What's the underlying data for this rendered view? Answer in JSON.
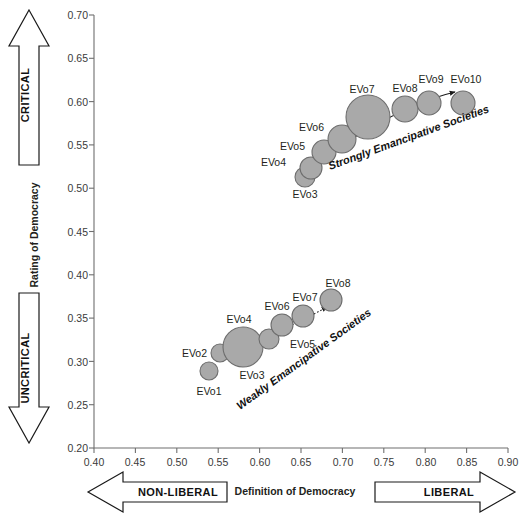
{
  "chart_data": {
    "type": "scatter",
    "title": "",
    "xlabel": "Definition of Democracy",
    "ylabel": "Rating of Democracy",
    "xlim": [
      0.4,
      0.9
    ],
    "ylim": [
      0.2,
      0.7
    ],
    "xticks": [
      "0.40",
      "0.45",
      "0.50",
      "0.55",
      "0.60",
      "0.65",
      "0.70",
      "0.75",
      "0.80",
      "0.85",
      "0.90"
    ],
    "yticks": [
      "0.20",
      "0.25",
      "0.30",
      "0.35",
      "0.40",
      "0.45",
      "0.50",
      "0.55",
      "0.60",
      "0.65",
      "0.70"
    ],
    "grid": false,
    "legend_position": "none",
    "bubble_note": "marker area encodes relative group size",
    "series": [
      {
        "name": "Strongly Emancipative Societies",
        "label": "Strongly Emancipative Societies",
        "trend": "solid-arrow",
        "points": [
          {
            "label": "EVo3",
            "x": 0.653,
            "y": 0.518,
            "size": 10
          },
          {
            "label": "EVo4",
            "x": 0.66,
            "y": 0.529,
            "size": 11
          },
          {
            "label": "EVo5",
            "x": 0.676,
            "y": 0.547,
            "size": 12
          },
          {
            "label": "EVo6",
            "x": 0.697,
            "y": 0.562,
            "size": 14
          },
          {
            "label": "EVo7",
            "x": 0.729,
            "y": 0.588,
            "size": 22
          },
          {
            "label": "EVo8",
            "x": 0.773,
            "y": 0.597,
            "size": 13
          },
          {
            "label": "EVo9",
            "x": 0.802,
            "y": 0.604,
            "size": 12
          },
          {
            "label": "EVo10",
            "x": 0.843,
            "y": 0.604,
            "size": 12
          }
        ]
      },
      {
        "name": "Weakly Emancipative Societies",
        "label": "Weakly Emancipative Societies",
        "trend": "dotted-arrow",
        "points": [
          {
            "label": "EVo1",
            "x": 0.556,
            "y": 0.279,
            "size": 9
          },
          {
            "label": "EVo2",
            "x": 0.567,
            "y": 0.3,
            "size": 9
          },
          {
            "label": "EVo3",
            "x": 0.592,
            "y": 0.308,
            "size": 20
          },
          {
            "label": "EVo4",
            "x": 0.592,
            "y": 0.308,
            "size": 20
          },
          {
            "label": "EVo5",
            "x": 0.619,
            "y": 0.317,
            "size": 10
          },
          {
            "label": "EVo6",
            "x": 0.63,
            "y": 0.333,
            "size": 11
          },
          {
            "label": "EVo7",
            "x": 0.647,
            "y": 0.344,
            "size": 11
          },
          {
            "label": "EVo8",
            "x": 0.667,
            "y": 0.362,
            "size": 11
          }
        ]
      }
    ]
  },
  "axes": {
    "y_title": "Rating of Democracy",
    "x_title": "Definition of Democracy"
  },
  "arrows": {
    "up_label": "CRITICAL",
    "down_label": "UNCRITICAL",
    "left_label": "NON-LIBERAL",
    "right_label": "LIBERAL"
  },
  "ticks": {
    "y": [
      "0.70",
      "0.65",
      "0.60",
      "0.55",
      "0.50",
      "0.45",
      "0.40",
      "0.35",
      "0.30",
      "0.25",
      "0.20"
    ],
    "x": [
      "0.40",
      "0.45",
      "0.50",
      "0.55",
      "0.60",
      "0.65",
      "0.70",
      "0.75",
      "0.80",
      "0.85",
      "0.90"
    ]
  },
  "clusters": {
    "strong": "Strongly Emancipative Societies",
    "weak": "Weakly Emancipative Societies"
  },
  "labels": {
    "strong": [
      "EVo3",
      "EVo4",
      "EVo5",
      "EVo6",
      "EVo7",
      "EVo8",
      "EVo9",
      "EVo10"
    ],
    "weak": [
      "EVo1",
      "EVo2",
      "EVo3",
      "EVo4",
      "EVo5",
      "EVo6",
      "EVo7",
      "EVo8"
    ]
  },
  "colors": {
    "bubble_fill": "#a9a9a9",
    "bubble_stroke": "#6d6d6d",
    "axis": "#6f6f6f",
    "text": "#231f20"
  }
}
